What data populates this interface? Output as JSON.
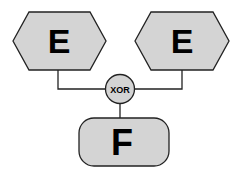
{
  "diagram": {
    "nodes": [
      {
        "id": "e-left",
        "shape": "hexagon",
        "label": "E"
      },
      {
        "id": "e-right",
        "shape": "hexagon",
        "label": "E"
      },
      {
        "id": "xor",
        "shape": "circle",
        "label": "XOR"
      },
      {
        "id": "f",
        "shape": "rounded-rect",
        "label": "F"
      }
    ],
    "edges": [
      {
        "from": "e-left",
        "to": "xor"
      },
      {
        "from": "e-right",
        "to": "xor"
      },
      {
        "from": "xor",
        "to": "f"
      }
    ],
    "colors": {
      "fill": "#d4d4d4",
      "stroke": "#222222",
      "line": "#222222"
    }
  }
}
